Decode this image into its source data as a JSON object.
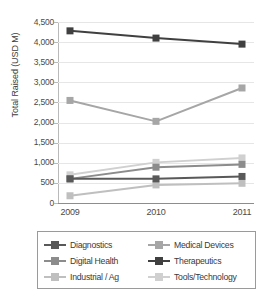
{
  "chart_data": {
    "type": "line",
    "title": "",
    "xlabel": "",
    "ylabel": "Total Raised (USD M)",
    "categories": [
      "2009",
      "2010",
      "2011"
    ],
    "ylim": [
      0,
      4500
    ],
    "ytick_labels": [
      "4,500",
      "4,000",
      "3,500",
      "3,000",
      "2,500",
      "2,000",
      "1,500",
      "1,000",
      "500",
      "0"
    ],
    "ytick_values": [
      4500,
      4000,
      3500,
      3000,
      2500,
      2000,
      1500,
      1000,
      500,
      0
    ],
    "grid": true,
    "legend_position": "bottom",
    "series": [
      {
        "name": "Diagnostics",
        "color": "#595959",
        "values": [
          600,
          600,
          660
        ]
      },
      {
        "name": "Medical Devices",
        "color": "#a6a6a6",
        "values": [
          2550,
          2030,
          2860
        ]
      },
      {
        "name": "Digital Health",
        "color": "#8c8c8c",
        "values": [
          600,
          890,
          960
        ]
      },
      {
        "name": "Therapeutics",
        "color": "#404040",
        "values": [
          4280,
          4100,
          3950
        ]
      },
      {
        "name": "Industrial / Ag",
        "color": "#bfbfbf",
        "values": [
          180,
          450,
          490
        ]
      },
      {
        "name": "Tools/Technology",
        "color": "#d0d0d0",
        "values": [
          700,
          1010,
          1120
        ]
      }
    ]
  },
  "legend": {
    "entries": [
      {
        "label": "Diagnostics",
        "color": "#595959"
      },
      {
        "label": "Medical Devices",
        "color": "#a6a6a6"
      },
      {
        "label": "Digital Health",
        "color": "#8c8c8c"
      },
      {
        "label": "Therapeutics",
        "color": "#404040"
      },
      {
        "label": "Industrial / Ag",
        "color": "#bfbfbf"
      },
      {
        "label": "Tools/Technology",
        "color": "#d0d0d0"
      }
    ]
  },
  "axes": {
    "y_title": "Total Raised (USD M)"
  }
}
